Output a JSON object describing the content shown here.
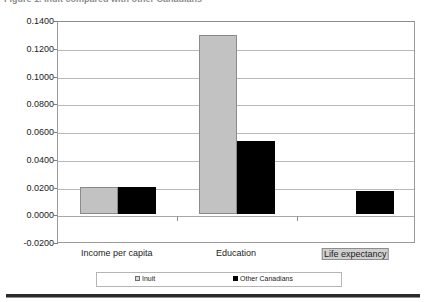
{
  "title": {
    "text": "Figure 1. Inuit compared with other Canadians"
  },
  "legend": {
    "position": "bottom",
    "entries": [
      {
        "label": "Inuit",
        "color": "#c2c2c2"
      },
      {
        "label": "Other Canadians",
        "color": "#000000"
      }
    ]
  },
  "axis": {
    "yticks": [
      "0.1400",
      "0.1200",
      "0.1000",
      "0.0800",
      "0.0600",
      "0.0400",
      "0.0200",
      "0.0000",
      "-0.0200"
    ],
    "xlabels": [
      "Income per capita",
      "Education",
      "Life expectancy"
    ]
  },
  "chart_data": {
    "type": "bar",
    "title": "Figure 1. Inuit compared with other Canadians",
    "xlabel": "",
    "ylabel": "",
    "categories": [
      "Income per capita",
      "Education",
      "Life expectancy"
    ],
    "series": [
      {
        "name": "Inuit",
        "color": "#c2c2c2",
        "values": [
          0.02,
          0.129,
          0.0
        ]
      },
      {
        "name": "Other Canadians",
        "color": "#000000",
        "values": [
          0.02,
          0.053,
          0.017
        ]
      }
    ],
    "ylim": [
      -0.02,
      0.14
    ],
    "ytick_step": 0.02,
    "grid": true,
    "legend_position": "bottom"
  }
}
